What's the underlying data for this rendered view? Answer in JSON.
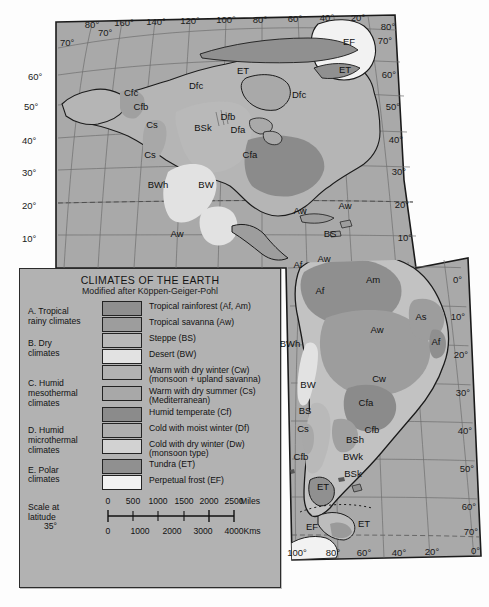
{
  "map": {
    "title": "Climates of the Earth — North and South America",
    "projection_note": "oblique/curved graticule",
    "longitude_labels_top": [
      "80°",
      "160°",
      "140°",
      "120°",
      "100°",
      "80°",
      "60°",
      "40°",
      "20°",
      "80°"
    ],
    "longitude_labels_bottom": [
      "100°",
      "80°",
      "60°",
      "40°",
      "20°",
      "0°"
    ],
    "latitude_labels_left": [
      "70°",
      "60°",
      "50°",
      "40°",
      "30°",
      "20°",
      "10°"
    ],
    "latitude_labels_right": [
      "70°",
      "60°",
      "50°",
      "40°",
      "30°",
      "20°",
      "10°",
      "0°",
      "10°",
      "20°",
      "30°",
      "40°",
      "50°",
      "60°",
      "70°",
      "0°"
    ],
    "climate_labels": [
      {
        "code": "EF",
        "x": 349,
        "y": 45
      },
      {
        "code": "ET",
        "x": 345,
        "y": 73
      },
      {
        "code": "ET",
        "x": 243,
        "y": 74
      },
      {
        "code": "Dfc",
        "x": 196,
        "y": 89
      },
      {
        "code": "Dfc",
        "x": 299,
        "y": 98
      },
      {
        "code": "Cfc",
        "x": 131,
        "y": 96
      },
      {
        "code": "Cfb",
        "x": 141,
        "y": 110
      },
      {
        "code": "Dfb",
        "x": 228,
        "y": 120
      },
      {
        "code": "Cs",
        "x": 152,
        "y": 128
      },
      {
        "code": "BSk",
        "x": 203,
        "y": 131
      },
      {
        "code": "Dfa",
        "x": 238,
        "y": 133
      },
      {
        "code": "Cfa",
        "x": 250,
        "y": 158
      },
      {
        "code": "Cs",
        "x": 150,
        "y": 158
      },
      {
        "code": "BWh",
        "x": 158,
        "y": 188
      },
      {
        "code": "BW",
        "x": 206,
        "y": 188
      },
      {
        "code": "Aw",
        "x": 300,
        "y": 214
      },
      {
        "code": "Aw",
        "x": 345,
        "y": 209
      },
      {
        "code": "Aw",
        "x": 177,
        "y": 237
      },
      {
        "code": "BS",
        "x": 330,
        "y": 237
      },
      {
        "code": "Af",
        "x": 298,
        "y": 268
      },
      {
        "code": "Aw",
        "x": 324,
        "y": 262
      },
      {
        "code": "Am",
        "x": 373,
        "y": 283
      },
      {
        "code": "Af",
        "x": 320,
        "y": 294
      },
      {
        "code": "As",
        "x": 421,
        "y": 320
      },
      {
        "code": "Aw",
        "x": 377,
        "y": 333
      },
      {
        "code": "Af",
        "x": 436,
        "y": 345
      },
      {
        "code": "BWh",
        "x": 290,
        "y": 347
      },
      {
        "code": "Cw",
        "x": 379,
        "y": 382
      },
      {
        "code": "BW",
        "x": 308,
        "y": 388
      },
      {
        "code": "Cfa",
        "x": 366,
        "y": 406
      },
      {
        "code": "BS",
        "x": 305,
        "y": 414
      },
      {
        "code": "Cfb",
        "x": 372,
        "y": 433
      },
      {
        "code": "Cs",
        "x": 303,
        "y": 432
      },
      {
        "code": "BSh",
        "x": 355,
        "y": 443
      },
      {
        "code": "BWk",
        "x": 353,
        "y": 460
      },
      {
        "code": "Cfb",
        "x": 301,
        "y": 460
      },
      {
        "code": "BSk",
        "x": 353,
        "y": 477
      },
      {
        "code": "ET",
        "x": 323,
        "y": 490
      },
      {
        "code": "EF",
        "x": 312,
        "y": 530
      },
      {
        "code": "ET",
        "x": 364,
        "y": 527
      }
    ]
  },
  "legend": {
    "title": "CLIMATES OF THE EARTH",
    "subtitle": "Modified after Köppen-Geiger-Pohl",
    "groups": [
      {
        "name": "A. Tropical\nrainy climates",
        "rows": [
          {
            "label": "Tropical rainforest (Af, Am)",
            "color": "#8f8f8f"
          },
          {
            "label": "Tropical savanna (Aw)",
            "color": "#9d9d9d"
          }
        ]
      },
      {
        "name": "B. Dry\nclimates",
        "rows": [
          {
            "label": "Steppe (BS)",
            "color": "#b9b9b9"
          },
          {
            "label": "Desert (BW)",
            "color": "#e2e2e2"
          }
        ]
      },
      {
        "name": "C. Humid\nmesothermal\nclimates",
        "rows": [
          {
            "label": "Warm with dry winter (Cw)\n(monsoon + upland savanna)",
            "color": "#b2b2b2"
          },
          {
            "label": "Warm with dry summer (Cs)\n(Mediterranean)",
            "color": "#a8a8a8"
          },
          {
            "label": "Humid temperate (Cf)",
            "color": "#8b8b8b"
          }
        ]
      },
      {
        "name": "D. Humid\nmicrothermal\nclimates",
        "rows": [
          {
            "label": "Cold with moist winter (Df)",
            "color": "#aeaeae"
          },
          {
            "label": "Cold with dry winter (Dw)\n(monsoon type)",
            "color": "#d2d2d2"
          }
        ]
      },
      {
        "name": "E. Polar\nclimates",
        "rows": [
          {
            "label": "Tundra (ET)",
            "color": "#909090"
          },
          {
            "label": "Perpetual frost (EF)",
            "color": "#f2f2f2"
          }
        ]
      }
    ],
    "scale": {
      "label_line1": "Scale at",
      "label_line2": "latitude",
      "label_line3": "35°",
      "miles_ticks": [
        "0",
        "500",
        "1000",
        "1500",
        "2000",
        "2500"
      ],
      "miles_unit": "Miles",
      "kms_ticks": [
        "0",
        "1000",
        "2000",
        "3000",
        "4000"
      ],
      "kms_unit": "Kms"
    }
  },
  "colors": {
    "page_background": "#fdfdfd",
    "ocean": "#a9a9a9",
    "land_base": "#c7c7c7",
    "legend_background": "#b2b2b2",
    "outline": "#1b1b1b",
    "tropical_rainforest": "#8f8f8f",
    "tropical_savanna": "#9d9d9d",
    "steppe": "#b9b9b9",
    "desert": "#e2e2e2",
    "humid_temperate": "#8b8b8b",
    "polar_frost": "#f2f2f2"
  }
}
